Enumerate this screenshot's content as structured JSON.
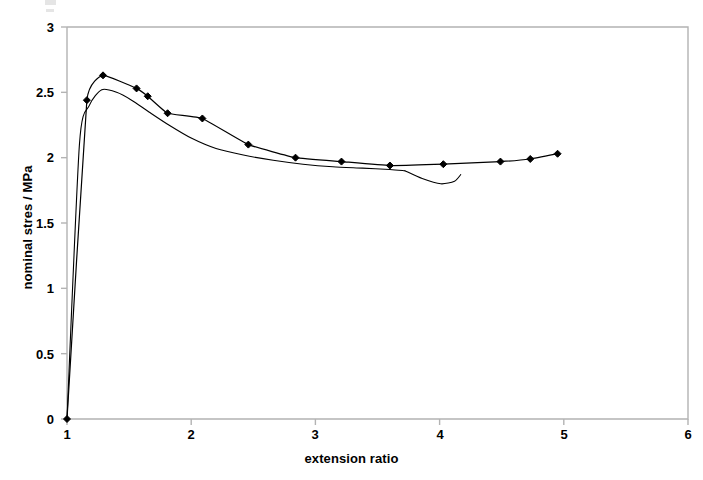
{
  "chart_data": {
    "type": "line",
    "title": "",
    "xlabel": "extension ratio",
    "ylabel": "nominal stres / MPa",
    "xlim": [
      1,
      6
    ],
    "ylim": [
      0,
      3
    ],
    "xticks": [
      "1",
      "2",
      "3",
      "4",
      "5",
      "6"
    ],
    "yticks": [
      "0",
      "0.5",
      "1",
      "1.5",
      "2",
      "2.5",
      "3"
    ],
    "grid": false,
    "legend": "none",
    "marker": "filled-diamond",
    "line_color": "#000000",
    "marker_color": "#000000",
    "frame_color": "#b3b3b3",
    "series": [
      {
        "name": "experimental (markers)",
        "marker": "filled-diamond",
        "x": [
          1.0,
          1.16,
          1.29,
          1.56,
          1.65,
          1.81,
          2.09,
          2.46,
          2.84,
          3.21,
          3.6,
          4.03,
          4.49,
          4.73,
          4.95
        ],
        "y": [
          0.0,
          2.44,
          2.63,
          2.53,
          2.47,
          2.34,
          2.3,
          2.1,
          2.0,
          1.97,
          1.94,
          1.95,
          1.97,
          1.99,
          2.03
        ]
      },
      {
        "name": "model (smooth)",
        "marker": "none",
        "x": [
          1.0,
          1.1,
          1.18,
          1.28,
          1.4,
          1.52,
          1.66,
          1.82,
          2.0,
          2.2,
          2.42,
          2.66,
          2.9,
          3.14,
          3.38,
          3.6,
          3.72
        ],
        "y": [
          0.0,
          2.1,
          2.4,
          2.52,
          2.5,
          2.44,
          2.35,
          2.25,
          2.15,
          2.07,
          2.02,
          1.98,
          1.95,
          1.93,
          1.92,
          1.91,
          1.9
        ]
      },
      {
        "name": "model tail hook",
        "marker": "none",
        "x": [
          3.72,
          3.86,
          4.01,
          4.12,
          4.17
        ],
        "y": [
          1.9,
          1.84,
          1.8,
          1.82,
          1.87
        ]
      }
    ]
  },
  "axis_labels": {
    "y": [
      {
        "value": "3",
        "top": 20
      },
      {
        "value": "2.5",
        "top": 85
      },
      {
        "value": "2",
        "top": 150
      },
      {
        "value": "1.5",
        "top": 216
      },
      {
        "value": "1",
        "top": 281
      },
      {
        "value": "0.5",
        "top": 347
      },
      {
        "value": "0",
        "top": 412
      }
    ],
    "x": [
      {
        "value": "1",
        "left": 47
      },
      {
        "value": "2",
        "left": 171
      },
      {
        "value": "3",
        "left": 295
      },
      {
        "value": "4",
        "left": 420
      },
      {
        "value": "5",
        "left": 544
      },
      {
        "value": "6",
        "left": 668
      }
    ]
  }
}
